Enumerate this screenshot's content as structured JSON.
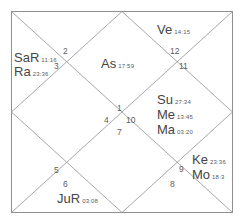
{
  "chart": {
    "type": "north-indian-vedic-birth-chart",
    "title": "",
    "border_color": "#8c8c8c",
    "line_color": "#9a9a9a",
    "text_color": "#454545",
    "background": "#ffffff",
    "houses": [
      {
        "number": "1",
        "name": "house-1",
        "x": 117,
        "y": 104
      },
      {
        "number": "2",
        "name": "house-2",
        "x": 63,
        "y": 47
      },
      {
        "number": "3",
        "name": "house-3",
        "x": 54,
        "y": 62
      },
      {
        "number": "4",
        "name": "house-4",
        "x": 104,
        "y": 116
      },
      {
        "number": "5",
        "name": "house-5",
        "x": 54,
        "y": 166
      },
      {
        "number": "6",
        "name": "house-6",
        "x": 63,
        "y": 180
      },
      {
        "number": "7",
        "name": "house-7",
        "x": 117,
        "y": 128
      },
      {
        "number": "8",
        "name": "house-8",
        "x": 170,
        "y": 180
      },
      {
        "number": "9",
        "name": "house-9",
        "x": 179,
        "y": 165
      },
      {
        "number": "10",
        "name": "house-10",
        "x": 126,
        "y": 116
      },
      {
        "number": "11",
        "name": "house-11",
        "x": 179,
        "y": 62
      },
      {
        "number": "12",
        "name": "house-12",
        "x": 170,
        "y": 47
      }
    ],
    "planets": [
      {
        "name": "saturn",
        "abbr": "SaR",
        "degree": "11:16",
        "x": 14,
        "y": 51
      },
      {
        "name": "rahu",
        "abbr": "Ra",
        "degree": "23:36",
        "x": 14,
        "y": 65
      },
      {
        "name": "venus",
        "abbr": "Ve",
        "degree": "14:15",
        "x": 157,
        "y": 23
      },
      {
        "name": "ascendant",
        "abbr": "As",
        "degree": "17:59",
        "x": 101,
        "y": 57
      },
      {
        "name": "sun",
        "abbr": "Su",
        "degree": "27:34",
        "x": 157,
        "y": 93
      },
      {
        "name": "mercury",
        "abbr": "Me",
        "degree": "13:45",
        "x": 157,
        "y": 108
      },
      {
        "name": "mars",
        "abbr": "Ma",
        "degree": "03:20",
        "x": 157,
        "y": 123
      },
      {
        "name": "ketu",
        "abbr": "Ke",
        "degree": "23:36",
        "x": 192,
        "y": 153
      },
      {
        "name": "moon",
        "abbr": "Mo",
        "degree": "18:3",
        "x": 192,
        "y": 168
      },
      {
        "name": "jupiter",
        "abbr": "JuR",
        "degree": "03:08",
        "x": 57,
        "y": 192
      }
    ]
  }
}
